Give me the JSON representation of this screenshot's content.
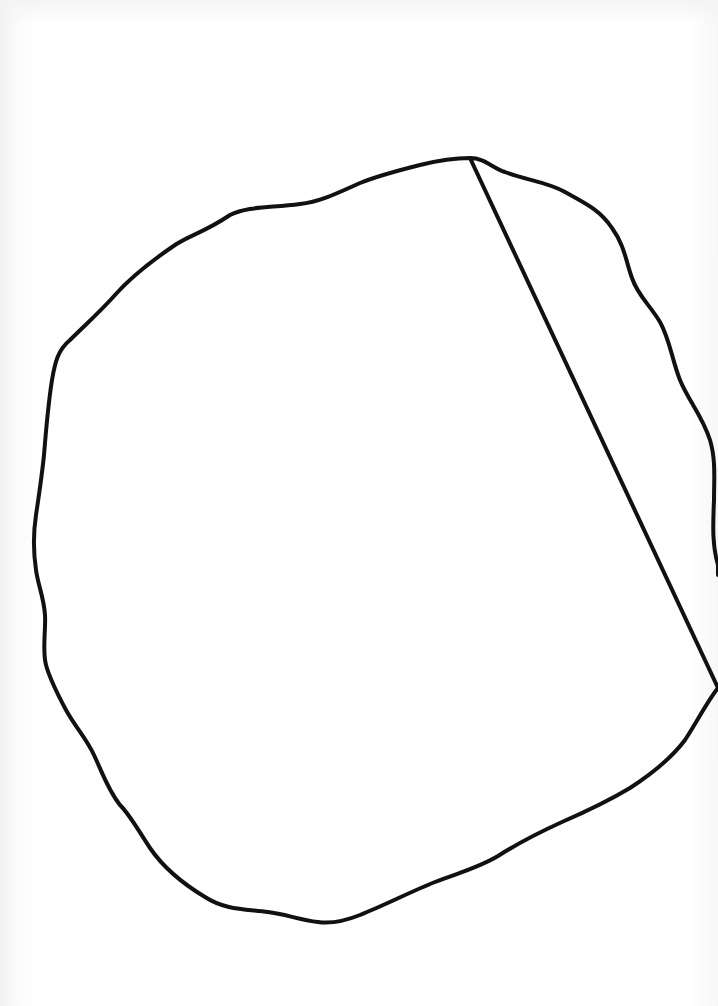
{
  "page": {
    "background_color": "#ffffff",
    "description": ""
  },
  "drawing": {
    "shape": "closed-irregular-loop",
    "stroke_color": "#111111",
    "stroke_width": 4,
    "fill": "none",
    "path": "M 470 158 C 485 158, 492 168, 505 172 C 525 180, 548 182, 565 192 C 585 203, 600 210, 612 228 C 625 246, 626 262, 632 278 C 638 296, 650 305, 660 322 C 670 340, 672 360, 680 380 C 688 400, 702 415, 710 440 C 716 460, 714 480, 714 500 C 713 525, 712 545, 718 565 L 718 575 M 718 688 C 708 700, 698 720, 685 740 C 670 760, 650 775, 630 788 C 605 803, 585 812, 562 822 C 540 832, 520 842, 498 856 C 478 868, 458 873, 435 882 C 410 892, 385 905, 360 915 C 345 921, 332 924, 318 922 C 300 920, 285 914, 268 912 C 245 909, 225 910, 205 897 C 185 885, 165 870, 150 848 C 138 830, 130 815, 120 805 C 108 790, 102 772, 94 755 C 86 738, 76 728, 66 710 C 58 695, 50 680, 46 665 C 42 650, 46 630, 45 615 C 44 598, 38 585, 36 570 C 33 550, 33 535, 36 515 C 39 495, 42 475, 44 455 C 46 430, 48 405, 52 380 C 55 362, 58 350, 70 340 C 85 325, 100 312, 115 295 C 130 278, 150 262, 175 245 C 190 235, 205 232, 230 215 C 248 206, 270 208, 300 204 C 320 202, 340 192, 360 183 C 380 175, 400 170, 420 165 C 440 160, 455 158, 470 158 Z"
  }
}
